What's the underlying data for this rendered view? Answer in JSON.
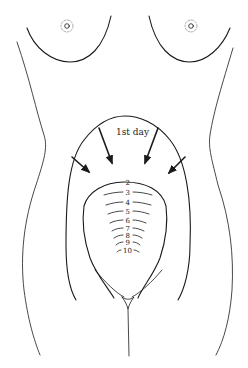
{
  "diagram": {
    "title_label": "1st day",
    "day_labels": [
      "2",
      "3",
      "4",
      "5",
      "6",
      "7",
      "8",
      "9",
      "10"
    ],
    "colors": {
      "line": "#1a1a1a",
      "background": "#ffffff"
    }
  }
}
